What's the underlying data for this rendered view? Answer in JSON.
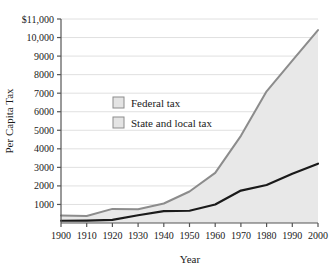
{
  "chart_data": {
    "type": "area",
    "title": "",
    "xlabel": "Year",
    "ylabel": "Per Capita Tax",
    "x": [
      1900,
      1910,
      1920,
      1930,
      1940,
      1950,
      1960,
      1970,
      1980,
      1990,
      2000
    ],
    "xlim": [
      1900,
      2000
    ],
    "ylim": [
      0,
      11000
    ],
    "grid": true,
    "legend_position": "upper-left-inside",
    "xticks": [
      "1900",
      "1910",
      "1920",
      "1930",
      "1940",
      "1950",
      "1960",
      "1970",
      "1980",
      "1990",
      "2000"
    ],
    "yticks": [
      "1000",
      "2000",
      "3000",
      "4000",
      "5000",
      "6000",
      "7000",
      "8000",
      "9000",
      "10,000",
      "$11,000"
    ],
    "ytick_values": [
      1000,
      2000,
      3000,
      4000,
      5000,
      6000,
      7000,
      8000,
      9000,
      10000,
      11000
    ],
    "series": [
      {
        "name": "Federal tax",
        "role": "upper-boundary-total",
        "color": "#8c8c8c",
        "values": [
          400,
          380,
          760,
          740,
          1050,
          1700,
          2700,
          4700,
          7100,
          8750,
          10400
        ]
      },
      {
        "name": "State and local tax",
        "role": "lower-boundary",
        "color": "#1a1a1a",
        "values": [
          120,
          130,
          170,
          420,
          640,
          660,
          1000,
          1750,
          2050,
          2650,
          3200
        ]
      }
    ],
    "colors": {
      "fill": "#e8e8e8",
      "gridline": "#e0e0e0",
      "axis": "#555555",
      "upper_line": "#8c8c8c",
      "lower_line": "#1a1a1a",
      "legend_swatch_fill": "#e4e4e4",
      "legend_swatch_border": "#8c8c8c",
      "plot_background": "#ffffff"
    }
  },
  "legend": {
    "items": [
      {
        "label": "Federal tax"
      },
      {
        "label": "State and local tax"
      }
    ]
  },
  "axes": {
    "x_title": "Year",
    "y_title": "Per Capita Tax"
  }
}
